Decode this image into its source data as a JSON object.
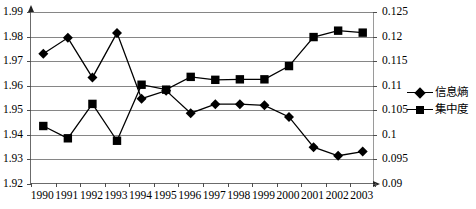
{
  "chart_data": {
    "type": "line",
    "title": "",
    "xlabel": "",
    "ylabel": "",
    "grid": true,
    "legend_position": "right",
    "categories": [
      "1990",
      "1991",
      "1992",
      "1993",
      "1994",
      "1995",
      "1996",
      "1997",
      "1998",
      "1999",
      "2000",
      "2001",
      "2002",
      "2003"
    ],
    "axes": {
      "left": {
        "label": "",
        "ylim": [
          1.92,
          1.99
        ],
        "ticks": [
          "1.92",
          "1.93",
          "1.94",
          "1.95",
          "1.96",
          "1.97",
          "1.98",
          "1.99"
        ],
        "tick_values": [
          1.92,
          1.93,
          1.94,
          1.95,
          1.96,
          1.97,
          1.98,
          1.99
        ],
        "step": 0.01
      },
      "right": {
        "label": "",
        "ylim": [
          0.09,
          0.125
        ],
        "ticks": [
          "0.09",
          "0.095",
          "0.1",
          "0.105",
          "0.11",
          "0.115",
          "0.12",
          "0.125"
        ],
        "tick_values": [
          0.09,
          0.095,
          0.1,
          0.105,
          0.11,
          0.115,
          0.12,
          0.125
        ],
        "step": 0.005
      }
    },
    "series": [
      {
        "name": "信息熵",
        "axis": "left",
        "marker": "diamond",
        "color": "#000000",
        "values": [
          1.973,
          1.9795,
          1.9633,
          1.9815,
          1.9547,
          1.958,
          1.9488,
          1.9525,
          1.9525,
          1.952,
          1.9473,
          1.935,
          1.9315,
          1.9332
        ]
      },
      {
        "name": "集中度",
        "axis": "right",
        "marker": "square",
        "color": "#000000",
        "values": [
          0.1018,
          0.0993,
          0.1063,
          0.0988,
          0.1102,
          0.1092,
          0.1118,
          0.1112,
          0.1113,
          0.1113,
          0.114,
          0.1199,
          0.1212,
          0.1208
        ]
      }
    ]
  },
  "legend": {
    "items": [
      {
        "label": "信息熵",
        "marker": "diamond"
      },
      {
        "label": "集中度",
        "marker": "square"
      }
    ]
  }
}
